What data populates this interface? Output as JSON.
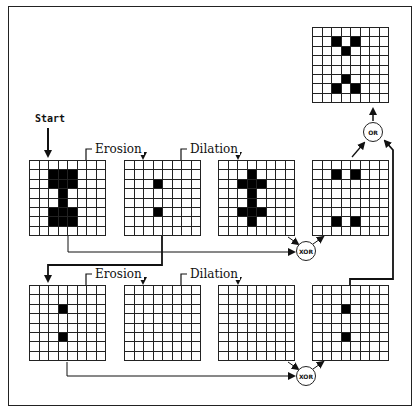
{
  "labels": {
    "start": "Start",
    "erosion_1": "Erosion",
    "dilation_1": "Dilation",
    "erosion_2": "Erosion",
    "dilation_2": "Dilation"
  },
  "operators": {
    "xor_top": "XOR",
    "xor_bottom": "XOR",
    "or": "OR"
  },
  "grids": {
    "output": [
      [
        1,
        2
      ],
      [
        1,
        4
      ],
      [
        2,
        3
      ],
      [
        5,
        3
      ],
      [
        6,
        2
      ],
      [
        6,
        4
      ]
    ],
    "row1_input": [
      [
        1,
        2
      ],
      [
        1,
        3
      ],
      [
        1,
        4
      ],
      [
        2,
        2
      ],
      [
        2,
        3
      ],
      [
        2,
        4
      ],
      [
        3,
        3
      ],
      [
        4,
        3
      ],
      [
        5,
        2
      ],
      [
        5,
        3
      ],
      [
        5,
        4
      ],
      [
        6,
        2
      ],
      [
        6,
        3
      ],
      [
        6,
        4
      ]
    ],
    "row1_eroded": [
      [
        2,
        3
      ],
      [
        5,
        3
      ]
    ],
    "row1_dilated": [
      [
        1,
        3
      ],
      [
        2,
        2
      ],
      [
        2,
        3
      ],
      [
        2,
        4
      ],
      [
        3,
        3
      ],
      [
        4,
        3
      ],
      [
        5,
        2
      ],
      [
        5,
        3
      ],
      [
        5,
        4
      ],
      [
        6,
        3
      ]
    ],
    "row1_xor": [
      [
        1,
        2
      ],
      [
        1,
        4
      ],
      [
        6,
        2
      ],
      [
        6,
        4
      ]
    ],
    "row2_input": [
      [
        2,
        3
      ],
      [
        5,
        3
      ]
    ],
    "row2_eroded": [],
    "row2_dilated": [],
    "row2_xor": [
      [
        2,
        3
      ],
      [
        5,
        3
      ]
    ]
  },
  "grid_size": {
    "cols": 8,
    "rows": 8
  }
}
